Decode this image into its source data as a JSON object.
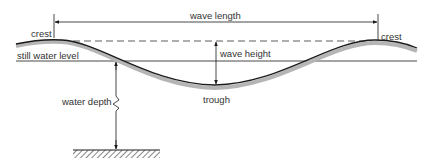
{
  "diagram": {
    "labels": {
      "wave_length": "wave length",
      "crest_left": "crest",
      "crest_right": "crest",
      "still_water_level": "still water level",
      "wave_height": "wave height",
      "water_depth": "water depth",
      "trough": "trough"
    },
    "colors": {
      "line": "#1a1a1a",
      "wave_shadow": "#b5b5b5",
      "text": "#333333"
    }
  }
}
